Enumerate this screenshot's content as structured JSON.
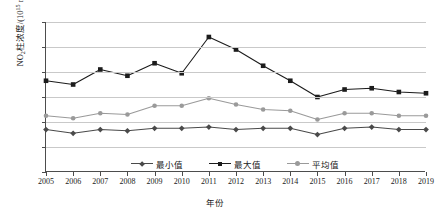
{
  "chart_data": {
    "type": "line",
    "title": "",
    "xlabel": "年份",
    "ylabel": "NO₂柱浓度/(10¹⁵ mol/cm²)",
    "ylabel_parts": {
      "prefix": "NO",
      "sub": "2",
      "mid": "柱浓度/(10",
      "sup": "15",
      "suffix": " mol/cm",
      "sup2": "2",
      "tail": ")"
    },
    "categories": [
      "2005",
      "2006",
      "2007",
      "2008",
      "2009",
      "2010",
      "2011",
      "2012",
      "2013",
      "2014",
      "2015",
      "2016",
      "2017",
      "2018",
      "2019"
    ],
    "yticks": [
      0,
      2,
      4,
      6,
      8,
      10,
      12
    ],
    "ylim": [
      0,
      12
    ],
    "grid": true,
    "legend_position": "bottom-center",
    "series": [
      {
        "name": "最小值",
        "marker": "diamond",
        "color": "#4a4a4a",
        "values": [
          3.4,
          3.1,
          3.4,
          3.3,
          3.5,
          3.5,
          3.6,
          3.4,
          3.5,
          3.5,
          3.0,
          3.5,
          3.6,
          3.4,
          3.4
        ]
      },
      {
        "name": "最大值",
        "marker": "square",
        "color": "#1c1c1c",
        "values": [
          7.3,
          7.0,
          8.2,
          7.7,
          8.7,
          7.9,
          10.8,
          9.8,
          8.5,
          7.3,
          6.0,
          6.6,
          6.7,
          6.4,
          6.3
        ]
      },
      {
        "name": "平均值",
        "marker": "circle",
        "color": "#9a9a9a",
        "values": [
          4.5,
          4.3,
          4.7,
          4.6,
          5.3,
          5.3,
          5.9,
          5.4,
          5.0,
          4.9,
          4.2,
          4.7,
          4.7,
          4.5,
          4.5
        ]
      }
    ]
  }
}
